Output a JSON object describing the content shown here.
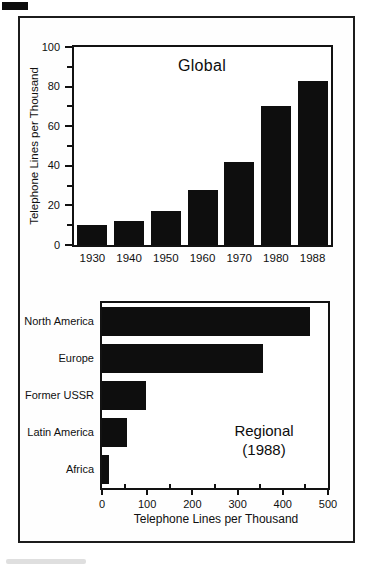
{
  "figure": {
    "corner_mark": true,
    "frame_color": "#1c1c1c",
    "background": "#ffffff"
  },
  "colors": {
    "bar": "#0e0e0e",
    "axis": "#121212",
    "text": "#101010"
  },
  "chart_data": [
    {
      "type": "bar",
      "title": "Global",
      "ylabel": "Telephone Lines per Thousand",
      "categories": [
        "1930",
        "1940",
        "1950",
        "1960",
        "1970",
        "1980",
        "1988"
      ],
      "values": [
        10,
        12,
        17,
        28,
        42,
        70,
        83
      ],
      "ylim": [
        0,
        100
      ],
      "yticks": [
        0,
        20,
        40,
        60,
        80,
        100
      ],
      "yticks_minor": [
        10,
        30,
        50,
        70,
        90
      ],
      "grid": false,
      "legend": "none",
      "bar_color": "#0e0e0e"
    },
    {
      "type": "bar-horizontal",
      "title": "Regional",
      "subtitle": "(1988)",
      "xlabel": "Telephone Lines per Thousand",
      "categories": [
        "North America",
        "Europe",
        "Former USSR",
        "Latin America",
        "Africa"
      ],
      "values": [
        460,
        355,
        97,
        55,
        15
      ],
      "xlim": [
        0,
        500
      ],
      "xticks": [
        0,
        100,
        200,
        300,
        400,
        500
      ],
      "xticks_minor": [
        50,
        150,
        250,
        350,
        450
      ],
      "grid": false,
      "legend": "none",
      "bar_color": "#0e0e0e"
    }
  ]
}
